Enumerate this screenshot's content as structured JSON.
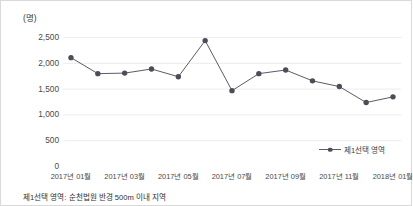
{
  "unit_label": "(명)",
  "legend": {
    "series_label": "제1선택 영역"
  },
  "footnote": "제1선택 영역: 순천법원 반경 500m 이내 지역",
  "colors": {
    "line": "#5b5b66",
    "marker": "#4d4d57",
    "grid": "#ececec",
    "axis": "#c8c8c8",
    "tick_text": "#4a4a4a",
    "border": "#d9d9d9"
  },
  "chart_data": {
    "type": "line",
    "title": "",
    "subtitle": "",
    "xlabel": "",
    "ylabel": "(명)",
    "ylim": [
      0,
      2500
    ],
    "yticks": [
      2500,
      2000,
      1500,
      1000,
      500,
      0
    ],
    "ytick_labels": [
      "2,500",
      "2,000",
      "1,500",
      "1,000",
      "500",
      "0"
    ],
    "grid": true,
    "legend_position": "bottom-right",
    "categories": [
      "2017년 01월",
      "2017년 02월",
      "2017년 03월",
      "2017년 04월",
      "2017년 05월",
      "2017년 06월",
      "2017년 07월",
      "2017년 08월",
      "2017년 09월",
      "2017년 10월",
      "2017년 11월",
      "2017년 12월",
      "2018년 01월"
    ],
    "xtick_labels": [
      "2017년 01월",
      "2017년 03월",
      "2017년 05월",
      "2017년 07월",
      "2017년 09월",
      "2017년 11월",
      "2018년 01월"
    ],
    "xtick_indices": [
      0,
      2,
      4,
      6,
      8,
      10,
      12
    ],
    "series": [
      {
        "name": "제1선택 영역",
        "values": [
          2100,
          1790,
          1800,
          1880,
          1730,
          2430,
          1460,
          1790,
          1860,
          1650,
          1540,
          1230,
          1340
        ]
      }
    ]
  }
}
